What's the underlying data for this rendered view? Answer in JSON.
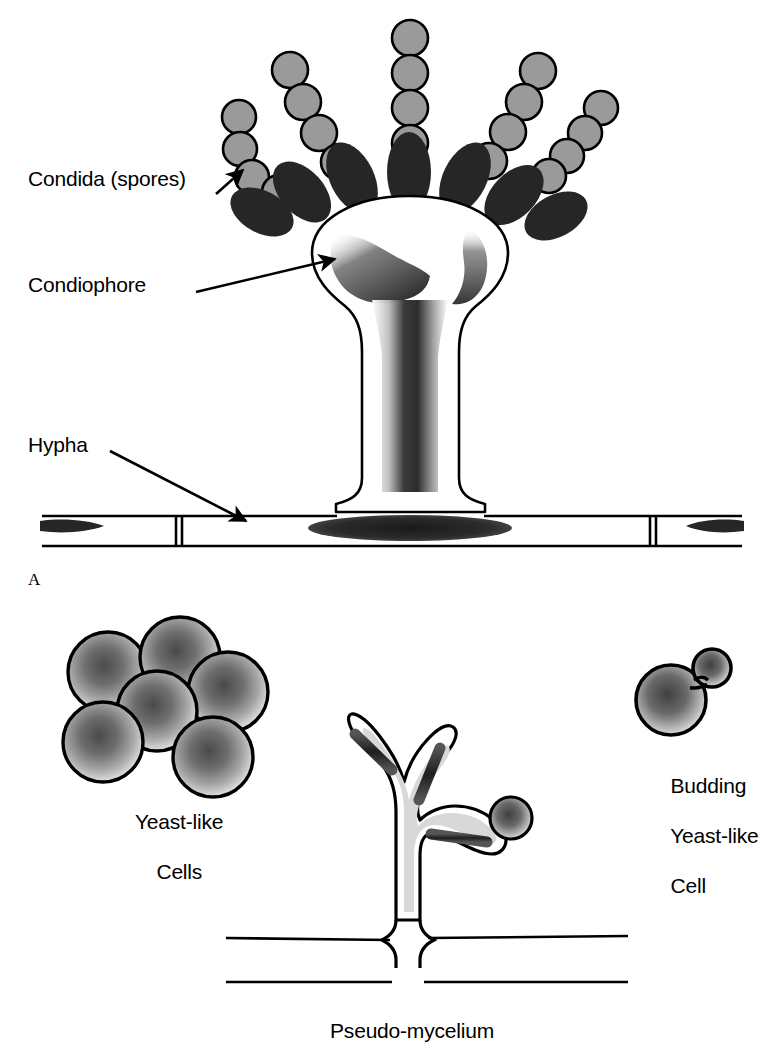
{
  "figure": {
    "background_color": "#ffffff",
    "ink_color": "#000000",
    "spore_fill_color": "#9a9a9a",
    "phialide_fill_color": "#262626",
    "nucleus_color": "#333333",
    "cytoplasm_color": "#d8d8d8"
  },
  "panels": {
    "a": {
      "letter": "A",
      "labels": {
        "conidia": "Condida (spores)",
        "conidiophore": "Condiophore",
        "hypha": "Hypha"
      }
    },
    "b": {
      "labels": {
        "yeast_cells": "Yeast-like\nCells",
        "budding_cell": "Budding\nYeast-like\nCell",
        "pseudo_mycelium": "Pseudo-mycelium"
      },
      "yeast_cells_line1": "Yeast-like",
      "yeast_cells_line2": "Cells",
      "budding_line1": "Budding",
      "budding_line2": "Yeast-like",
      "budding_line3": "Cell",
      "pseudo_mycelium": "Pseudo-mycelium"
    }
  },
  "structures": {
    "conidia_chains": [
      {
        "name": "chain-far-left",
        "spore_count": 4,
        "angle_deg": -140
      },
      {
        "name": "chain-left",
        "spore_count": 4,
        "angle_deg": -118
      },
      {
        "name": "chain-center",
        "spore_count": 4,
        "angle_deg": -90
      },
      {
        "name": "chain-right",
        "spore_count": 4,
        "angle_deg": -62
      },
      {
        "name": "chain-far-right",
        "spore_count": 4,
        "angle_deg": -40
      }
    ],
    "phialide_count": 7,
    "yeast_cell_cluster_count": 6,
    "budding_cell_parts": [
      "mother-cell",
      "bud",
      "neck"
    ],
    "hypha_septa_count": 3,
    "hypha_nuclei_count": 3
  }
}
